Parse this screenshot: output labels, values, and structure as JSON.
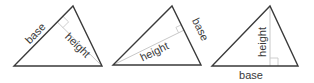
{
  "diagram": {
    "colors": {
      "outline": "#3a3a3a",
      "height_line": "#c8c8c8",
      "label": "#3a3a3a",
      "background": "#ffffff"
    },
    "triangles": [
      {
        "id": "left-base",
        "base_side": "left",
        "labels": {
          "base": "base",
          "height": "height"
        }
      },
      {
        "id": "right-base",
        "base_side": "right",
        "labels": {
          "base": "base",
          "height": "height"
        }
      },
      {
        "id": "bottom-base",
        "base_side": "bottom",
        "labels": {
          "base": "base",
          "height": "height"
        }
      }
    ]
  }
}
